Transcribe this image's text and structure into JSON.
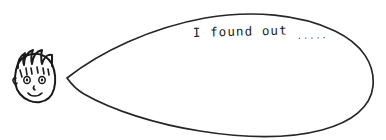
{
  "canvas": {
    "width": 386,
    "height": 140,
    "background_color": "#ffffff",
    "ink_color": "#1a1a1a",
    "style": "hand-drawn black ink line art"
  },
  "artwork": {
    "title": "cartoon boy with speech balloon",
    "character": {
      "name": "boy-face",
      "description": "round cartoon face with spiky messy hair, two eyes, small nose and smiling mouth",
      "features": [
        "spiky-hair",
        "left-eye",
        "right-eye",
        "nose",
        "smiling-mouth",
        "ear"
      ]
    },
    "speech_balloon": {
      "name": "speech-balloon",
      "shape": "large elongated oval with pointed tail",
      "tail_direction": "left toward the face",
      "text": "I found out",
      "trailing_dots": ".....",
      "full_text": "I found out....."
    }
  }
}
